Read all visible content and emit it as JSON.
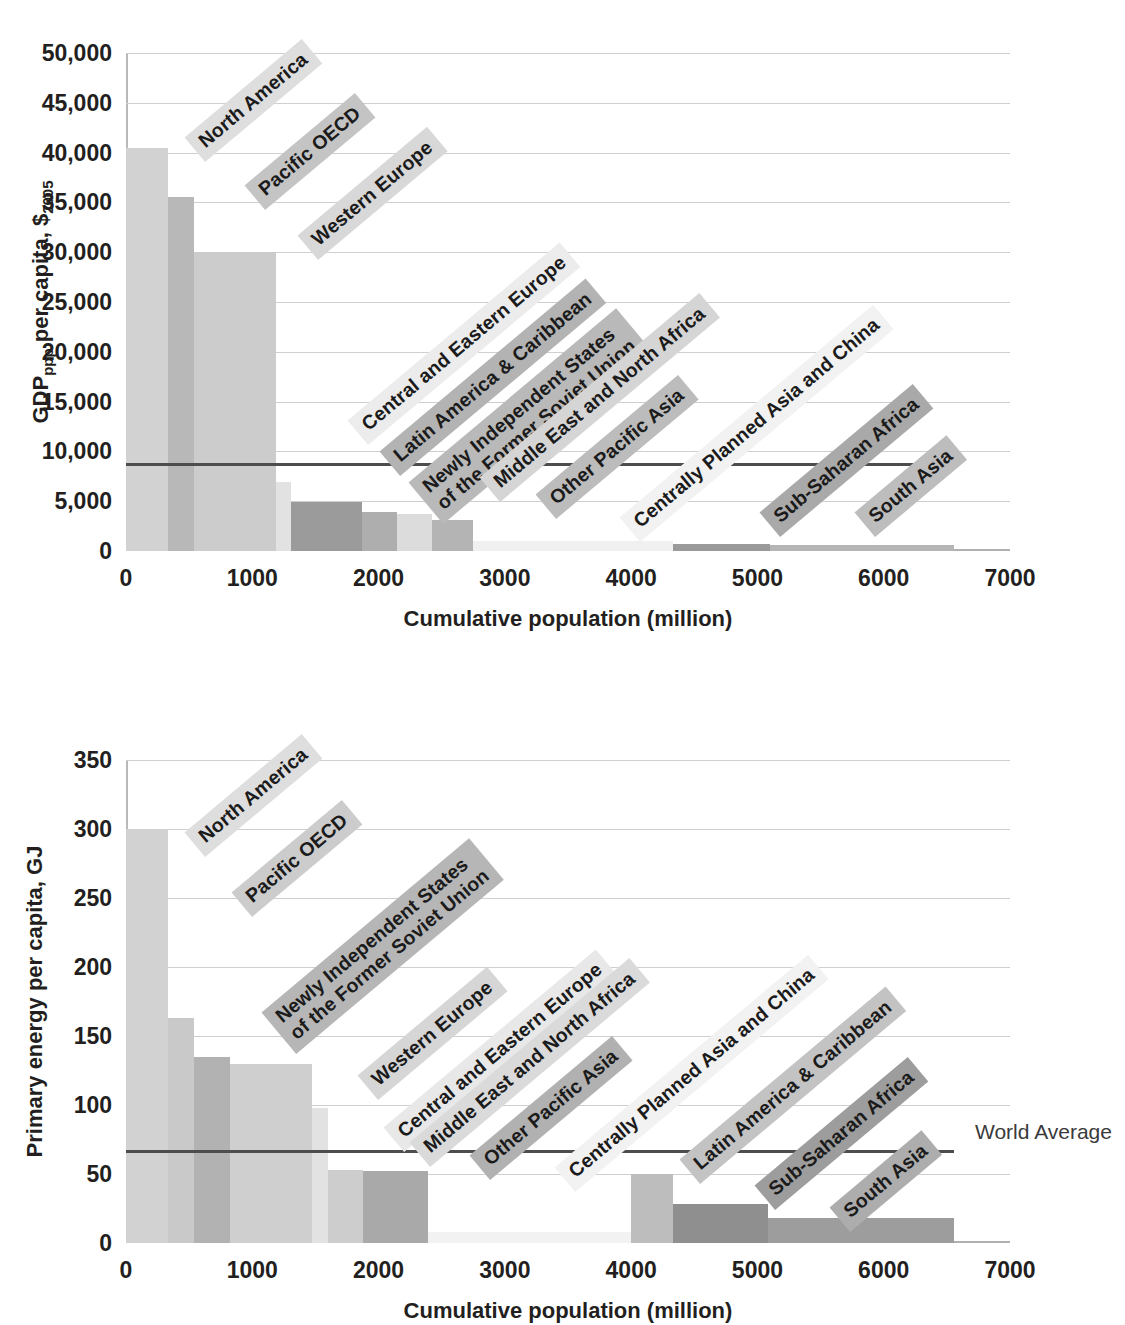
{
  "figure": {
    "xlabel": "Cumulative population (million)",
    "world_average_label": "World Average"
  },
  "charts": [
    {
      "id": "gdp",
      "ylabel_main": "GDP",
      "ylabel_sub1": "ppp",
      "ylabel_mid": " per capita, $",
      "ylabel_sub2": "2005",
      "ylabel_plain": "GDPppp per capita, $2005",
      "yticks": [
        "0",
        "5,000",
        "10,000",
        "15,000",
        "20,000",
        "25,000",
        "30,000",
        "35,000",
        "40,000",
        "45,000",
        "50,000"
      ],
      "xticks": [
        "0",
        "1000",
        "2000",
        "3000",
        "4000",
        "5000",
        "6000",
        "7000"
      ],
      "world_average": 8700
    },
    {
      "id": "energy",
      "ylabel_plain": "Primary energy per capita, GJ",
      "yticks": [
        "0",
        "50",
        "100",
        "150",
        "200",
        "250",
        "300",
        "350"
      ],
      "xticks": [
        "0",
        "1000",
        "2000",
        "3000",
        "4000",
        "5000",
        "6000",
        "7000"
      ],
      "world_average": 67,
      "world_average_label": "World Average"
    }
  ],
  "chart_data": [
    {
      "type": "bar",
      "title": "GDPppp per capita vs cumulative population",
      "xlabel": "Cumulative population (million)",
      "ylabel": "GDPppp per capita, $2005",
      "xlim": [
        0,
        7000
      ],
      "ylim": [
        0,
        50000
      ],
      "ytick_step": 5000,
      "xtick_step": 1000,
      "grid": true,
      "legend": "none",
      "annotations": [
        {
          "name": "world-average-line",
          "value": 8700,
          "label": ""
        }
      ],
      "bars": [
        {
          "label": "North America",
          "x_start": 0,
          "x_end": 335,
          "population": 335,
          "value": 40500,
          "color": "#d2d2d2"
        },
        {
          "label": "Pacific OECD",
          "x_start": 335,
          "x_end": 535,
          "population": 200,
          "value": 35500,
          "color": "#b8b8b8"
        },
        {
          "label": "Western Europe",
          "x_start": 535,
          "x_end": 1185,
          "population": 650,
          "value": 30000,
          "color": "#cccccc"
        },
        {
          "label": "Central and Eastern Europe",
          "x_start": 1185,
          "x_end": 1305,
          "population": 120,
          "value": 6900,
          "color": "#e2e2e2"
        },
        {
          "label": "Latin America & Caribbean",
          "x_start": 1305,
          "x_end": 1865,
          "population": 560,
          "value": 4950,
          "color": "#9b9b9b"
        },
        {
          "label": "Newly Independent States of the Former Soviet Union",
          "x_start": 1865,
          "x_end": 2145,
          "population": 280,
          "value": 3900,
          "color": "#aeaeae"
        },
        {
          "label": "Middle East and North Africa",
          "x_start": 2145,
          "x_end": 2420,
          "population": 275,
          "value": 3700,
          "color": "#dcdcdc"
        },
        {
          "label": "Other Pacific Asia",
          "x_start": 2420,
          "x_end": 2750,
          "population": 330,
          "value": 3150,
          "color": "#b4b4b4"
        },
        {
          "label": "Centrally Planned Asia and China",
          "x_start": 2750,
          "x_end": 4330,
          "population": 1580,
          "value": 1050,
          "color": "#f0f0f0"
        },
        {
          "label": "Sub-Saharan Africa",
          "x_start": 4330,
          "x_end": 5100,
          "population": 770,
          "value": 700,
          "color": "#9a9a9a"
        },
        {
          "label": "South Asia",
          "x_start": 5100,
          "x_end": 6560,
          "population": 1460,
          "value": 600,
          "color": "#b5b5b5"
        }
      ]
    },
    {
      "type": "bar",
      "title": "Primary energy per capita vs cumulative population",
      "xlabel": "Cumulative population (million)",
      "ylabel": "Primary energy per capita, GJ",
      "xlim": [
        0,
        7000
      ],
      "ylim": [
        0,
        350
      ],
      "ytick_step": 50,
      "xtick_step": 1000,
      "grid": true,
      "legend": "none",
      "annotations": [
        {
          "name": "world-average-line",
          "value": 67,
          "label": "World Average"
        }
      ],
      "bars": [
        {
          "label": "North America",
          "x_start": 0,
          "x_end": 335,
          "population": 335,
          "value": 300,
          "color": "#d2d2d2"
        },
        {
          "label": "Pacific OECD",
          "x_start": 335,
          "x_end": 535,
          "population": 200,
          "value": 163,
          "color": "#c9c9c9"
        },
        {
          "label": "Newly Independent States of the Former Soviet Union",
          "x_start": 535,
          "x_end": 820,
          "population": 285,
          "value": 135,
          "color": "#b2b2b2"
        },
        {
          "label": "Western Europe",
          "x_start": 820,
          "x_end": 1470,
          "population": 650,
          "value": 130,
          "color": "#cfcfcf"
        },
        {
          "label": "Central and Eastern Europe",
          "x_start": 1470,
          "x_end": 1600,
          "population": 130,
          "value": 98,
          "color": "#e2e2e2"
        },
        {
          "label": "Middle East and North Africa",
          "x_start": 1600,
          "x_end": 1880,
          "population": 280,
          "value": 53,
          "color": "#cdcdcd"
        },
        {
          "label": "Other Pacific Asia",
          "x_start": 1880,
          "x_end": 2390,
          "population": 510,
          "value": 52,
          "color": "#a9a9a9"
        },
        {
          "label": "Centrally Planned Asia and China",
          "x_start": 2390,
          "x_end": 4000,
          "population": 1610,
          "value": 8,
          "color": "#f2f2f2"
        },
        {
          "label": "Latin America & Caribbean",
          "x_start": 4000,
          "x_end": 4330,
          "population": 330,
          "value": 50,
          "color": "#bdbdbd"
        },
        {
          "label": "Sub-Saharan Africa",
          "x_start": 4330,
          "x_end": 5080,
          "population": 750,
          "value": 28,
          "color": "#8f8f8f"
        },
        {
          "label": "South Asia",
          "x_start": 5080,
          "x_end": 6560,
          "population": 1480,
          "value": 18,
          "color": "#9d9d9d"
        }
      ]
    }
  ],
  "labels_top": [
    {
      "text": "North America",
      "x": 205,
      "y": 130,
      "bg": "#dedede",
      "lines": 1
    },
    {
      "text": "Pacific OECD",
      "x": 265,
      "y": 178,
      "bg": "#c4c4c4",
      "lines": 1
    },
    {
      "text": "Western Europe",
      "x": 318,
      "y": 228,
      "bg": "#d8d8d8",
      "lines": 1
    },
    {
      "text": "Central and Eastern Europe",
      "x": 368,
      "y": 413,
      "bg": "#ececec",
      "lines": 1
    },
    {
      "text": "Latin America & Caribbean",
      "x": 400,
      "y": 444,
      "bg": "#b3b3b3",
      "lines": 1
    },
    {
      "text": "Newly Independent States|of the Former Soviet Union",
      "x": 443,
      "y": 470,
      "bg": "#b9b9b9",
      "lines": 2
    },
    {
      "text": "Middle East and North Africa",
      "x": 500,
      "y": 470,
      "bg": "#d5d5d5",
      "lines": 1
    },
    {
      "text": "Other Pacific Asia",
      "x": 556,
      "y": 487,
      "bg": "#bcbcbc",
      "lines": 1
    },
    {
      "text": "Centrally Planned Asia  and China",
      "x": 640,
      "y": 510,
      "bg": "#f2f2f2",
      "lines": 1
    },
    {
      "text": "Sub-Saharan Africa",
      "x": 780,
      "y": 505,
      "bg": "#a9a9a9",
      "lines": 1
    },
    {
      "text": "South Asia",
      "x": 875,
      "y": 505,
      "bg": "#bdbdbd",
      "lines": 1
    }
  ],
  "labels_bottom": [
    {
      "text": "North America",
      "x": 205,
      "y": 825,
      "bg": "#dedede",
      "lines": 1
    },
    {
      "text": "Pacific OECD",
      "x": 252,
      "y": 885,
      "bg": "#cccccc",
      "lines": 1
    },
    {
      "text": "Newly Independent States|of the Former Soviet Union",
      "x": 296,
      "y": 1000,
      "bg": "#b6b6b6",
      "lines": 2
    },
    {
      "text": "Western Europe",
      "x": 378,
      "y": 1068,
      "bg": "#d6d6d6",
      "lines": 1
    },
    {
      "text": "Central and Eastern Europe",
      "x": 404,
      "y": 1120,
      "bg": "#e8e8e8",
      "lines": 1
    },
    {
      "text": "Middle East and North Africa",
      "x": 430,
      "y": 1135,
      "bg": "#dadada",
      "lines": 1
    },
    {
      "text": "Other Pacific Asia",
      "x": 490,
      "y": 1148,
      "bg": "#b1b1b1",
      "lines": 1
    },
    {
      "text": "Centrally Planned Asia  and China",
      "x": 575,
      "y": 1160,
      "bg": "#f2f2f2",
      "lines": 1
    },
    {
      "text": "Latin America & Caribbean",
      "x": 700,
      "y": 1152,
      "bg": "#c3c3c3",
      "lines": 1
    },
    {
      "text": "Sub-Saharan Africa",
      "x": 775,
      "y": 1178,
      "bg": "#9d9d9d",
      "lines": 1
    },
    {
      "text": "South Asia",
      "x": 850,
      "y": 1200,
      "bg": "#adadad",
      "lines": 1
    }
  ]
}
